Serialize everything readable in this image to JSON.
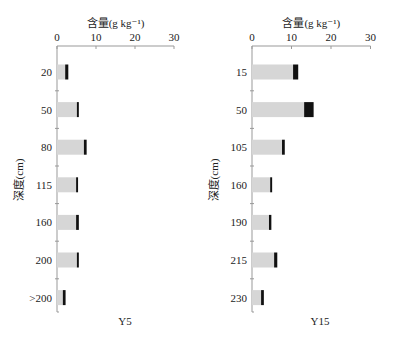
{
  "chart_data": [
    {
      "type": "bar",
      "orientation": "horizontal",
      "stacked": true,
      "title": "Y5",
      "xlabel": "含量(g kg⁻¹)",
      "ylabel": "深度(cm)",
      "xlim": [
        0,
        30
      ],
      "xticks": [
        "0",
        "10",
        "20",
        "30"
      ],
      "categories": [
        "20",
        "50",
        "80",
        "115",
        "160",
        "200",
        ">200"
      ],
      "series": [
        {
          "name": "light",
          "color": "#d6d6d6",
          "values": [
            2.1,
            5.1,
            6.9,
            4.9,
            4.9,
            5.1,
            1.5
          ]
        },
        {
          "name": "dark",
          "color": "#111111",
          "values": [
            0.8,
            0.5,
            0.7,
            0.5,
            0.7,
            0.5,
            0.7
          ]
        }
      ],
      "grid": false,
      "legend": null
    },
    {
      "type": "bar",
      "orientation": "horizontal",
      "stacked": true,
      "title": "Y15",
      "xlabel": "含量(g kg⁻¹)",
      "ylabel": "深度(cm)",
      "xlim": [
        0,
        30
      ],
      "xticks": [
        "0",
        "10",
        "20",
        "30"
      ],
      "categories": [
        "15",
        "50",
        "105",
        "160",
        "190",
        "215",
        "230"
      ],
      "series": [
        {
          "name": "light",
          "color": "#d6d6d6",
          "values": [
            10.4,
            13.2,
            7.6,
            4.6,
            4.3,
            5.6,
            2.3
          ]
        },
        {
          "name": "dark",
          "color": "#111111",
          "values": [
            1.3,
            2.4,
            0.7,
            0.5,
            0.6,
            0.8,
            0.7
          ]
        }
      ],
      "grid": false,
      "legend": null
    }
  ]
}
